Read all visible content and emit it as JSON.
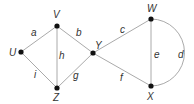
{
  "graph": {
    "nodes": [
      {
        "id": "U",
        "x": 21,
        "y": 52,
        "lx": 9,
        "ly": 56
      },
      {
        "id": "V",
        "x": 57,
        "y": 26,
        "lx": 53,
        "ly": 18
      },
      {
        "id": "Y",
        "x": 93,
        "y": 53,
        "lx": 95,
        "ly": 49
      },
      {
        "id": "Z",
        "x": 57,
        "y": 88,
        "lx": 53,
        "ly": 101
      },
      {
        "id": "W",
        "x": 151,
        "y": 19,
        "lx": 147,
        "ly": 12
      },
      {
        "id": "X",
        "x": 151,
        "y": 86,
        "lx": 147,
        "ly": 100
      }
    ],
    "edges": [
      {
        "label": "a",
        "from": "U",
        "to": "V",
        "lx": 31,
        "ly": 36
      },
      {
        "label": "b",
        "from": "V",
        "to": "Y",
        "lx": 76,
        "ly": 36
      },
      {
        "label": "h",
        "from": "V",
        "to": "Z",
        "lx": 59,
        "ly": 59
      },
      {
        "label": "i",
        "from": "U",
        "to": "Z",
        "lx": 34,
        "ly": 78
      },
      {
        "label": "g",
        "from": "Z",
        "to": "Y",
        "lx": 73,
        "ly": 79
      },
      {
        "label": "c",
        "from": "Y",
        "to": "W",
        "lx": 120,
        "ly": 33
      },
      {
        "label": "f",
        "from": "Y",
        "to": "X",
        "lx": 120,
        "ly": 81
      },
      {
        "label": "e",
        "from": "W",
        "to": "X",
        "lx": 154,
        "ly": 58
      },
      {
        "label": "d",
        "from": "W",
        "to": "X",
        "curved": true,
        "lx": 178,
        "ly": 58
      }
    ]
  }
}
